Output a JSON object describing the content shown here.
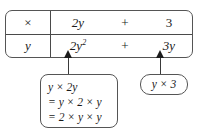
{
  "diagram": {
    "accent_color": "#1c1c1c",
    "border_color": "#555555"
  },
  "grid": {
    "header_row": {
      "multiply_symbol": "×",
      "term1": "2y",
      "operator": "+",
      "term2": "3"
    },
    "product_row": {
      "multiplier": "y",
      "product1_base": "2y",
      "product1_exponent": "2",
      "operator": "+",
      "product2": "3y"
    }
  },
  "callouts": {
    "left": {
      "arrow": "up-arrow-icon",
      "lines": [
        "y × 2y",
        "= y × 2 × y",
        "= 2 × y × y"
      ]
    },
    "right": {
      "arrow": "up-arrow-icon",
      "lines": [
        "y × 3"
      ]
    }
  }
}
